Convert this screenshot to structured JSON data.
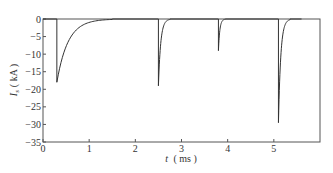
{
  "chart_data": {
    "type": "line",
    "title": "",
    "xlabel": "t (ms)",
    "xlabel_var": "t",
    "xlabel_unit": "( ms )",
    "ylabel": "I_s (kA)",
    "ylabel_var": "I",
    "ylabel_sub": "s",
    "ylabel_unit": "( kA )",
    "xlim": [
      0,
      6
    ],
    "ylim": [
      -35,
      0
    ],
    "xticks": [
      0,
      1,
      2,
      3,
      4,
      5
    ],
    "yticks": [
      0,
      -5,
      -10,
      -15,
      -20,
      -25,
      -30,
      -35
    ],
    "grid": false,
    "legend": null,
    "series": [
      {
        "name": "I_s",
        "color": "#333333",
        "pulses": [
          {
            "t_start": 0.3,
            "peak": -18.0,
            "decay_end": 1.5
          },
          {
            "t_start": 2.5,
            "peak": -19.0,
            "decay_end": 2.75
          },
          {
            "t_start": 3.8,
            "peak": -9.0,
            "decay_end": 3.95
          },
          {
            "t_start": 5.1,
            "peak": -29.5,
            "decay_end": 5.35
          }
        ]
      }
    ]
  },
  "labels": {
    "x_ticks": [
      "0",
      "1",
      "2",
      "3",
      "4",
      "5"
    ],
    "y_ticks": [
      "0",
      "−5",
      "−10",
      "−15",
      "−20",
      "−25",
      "−30",
      "−35"
    ]
  }
}
